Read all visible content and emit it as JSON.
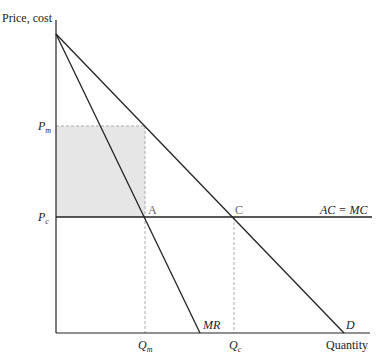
{
  "diagram": {
    "axis_y_label": "Price, cost",
    "axis_x_label": "Quantity",
    "price_labels": {
      "pm": "P",
      "pm_sub": "m",
      "pc": "P",
      "pc_sub": "c"
    },
    "quantity_labels": {
      "qm": "Q",
      "qm_sub": "m",
      "qc": "Q",
      "qc_sub": "c"
    },
    "curve_labels": {
      "mr": "MR",
      "d": "D",
      "acmc": "AC = MC"
    },
    "points": {
      "a": "A",
      "c": "C"
    },
    "colors": {
      "line": "#222222",
      "shade": "#e6e6e6",
      "dash": "#aaaaaa"
    }
  }
}
